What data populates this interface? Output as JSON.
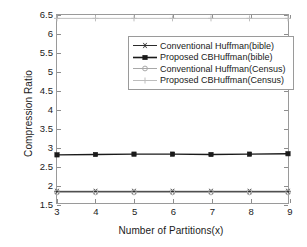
{
  "chart_data": {
    "type": "line",
    "title": "",
    "xlabel": "Number of Partitions(x)",
    "ylabel": "Compression Ratio",
    "x": [
      3,
      4,
      5,
      6,
      7,
      8,
      9
    ],
    "xlim": [
      3,
      9
    ],
    "ylim": [
      1.5,
      6.5
    ],
    "xticks": [
      "3",
      "4",
      "5",
      "6",
      "7",
      "8",
      "9"
    ],
    "yticks": [
      "1.5",
      "2",
      "2.5",
      "3",
      "3.5",
      "4",
      "4.5",
      "5",
      "5.5",
      "6",
      "6.5"
    ],
    "grid": false,
    "legend_position": "upper-center-right",
    "series": [
      {
        "name": "Conventional Huffman(bible)",
        "marker": "star-marker",
        "color": "#2b2b2b",
        "values": [
          1.81,
          1.81,
          1.81,
          1.81,
          1.81,
          1.81,
          1.81
        ]
      },
      {
        "name": "Proposed CBHuffman(bible)",
        "marker": "square-marker",
        "color": "#1a1a1a",
        "values": [
          2.78,
          2.79,
          2.8,
          2.8,
          2.79,
          2.8,
          2.81
        ]
      },
      {
        "name": "Conventional Huffman(Census)",
        "marker": "circle-marker",
        "color": "#a8a8a8",
        "values": [
          1.78,
          1.78,
          1.78,
          1.78,
          1.78,
          1.78,
          1.78
        ]
      },
      {
        "name": "Proposed CBHuffman(Census)",
        "marker": "plus-marker",
        "color": "#bdbdbd",
        "values": [
          6.41,
          6.41,
          6.41,
          6.41,
          6.41,
          6.41,
          6.41
        ]
      }
    ]
  },
  "axes": {
    "y_title": "Compression Ratio",
    "x_title": "Number of Partitions(x)"
  },
  "legend": {
    "entries": [
      {
        "label": "Conventional Huffman(bible)"
      },
      {
        "label": "Proposed CBHuffman(bible)"
      },
      {
        "label": "Conventional Huffman(Census)"
      },
      {
        "label": "Proposed CBHuffman(Census)"
      }
    ]
  },
  "colors": {
    "frame": "#9a9a9a",
    "dark_series": "#1a1a1a",
    "light_series": "#b5b5b5",
    "background": "#ffffff"
  }
}
